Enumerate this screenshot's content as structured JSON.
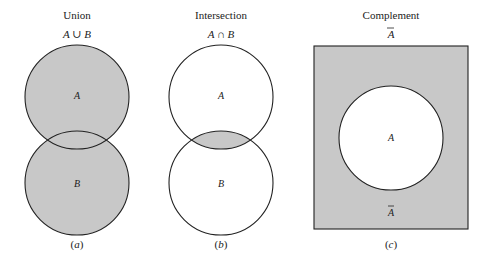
{
  "colors": {
    "shade": "#c8c8c8",
    "stroke": "#222222",
    "background": "#ffffff"
  },
  "panels": [
    {
      "title": "Union",
      "expression": "A ∪ B",
      "label_a": "A",
      "label_b": "B",
      "caption": "(a)"
    },
    {
      "title": "Intersection",
      "expression": "A ∩ B",
      "label_a": "A",
      "label_b": "B",
      "caption": "(b)"
    },
    {
      "title": "Complement",
      "expression": "A",
      "label_inner": "A",
      "label_outer": "A",
      "caption": "(c)"
    }
  ]
}
